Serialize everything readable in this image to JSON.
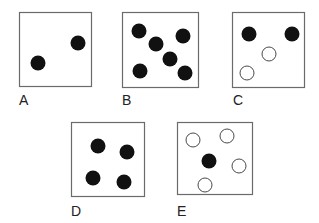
{
  "colors": {
    "background": "#ffffff",
    "box_stroke": "#6b6b6b",
    "filled_dot": "#111111",
    "open_dot_stroke": "#4a4a4a",
    "open_dot_fill": "#ffffff",
    "label": "#222222"
  },
  "dot_radius": 7.5,
  "panels": [
    {
      "label": "A",
      "box": {
        "x": 19,
        "y": 12,
        "w": 72,
        "h": 74
      },
      "label_pos": {
        "x": 19,
        "y": 93
      },
      "dots": [
        {
          "cx": 38,
          "cy": 63,
          "filled": true
        },
        {
          "cx": 78,
          "cy": 43,
          "filled": true
        }
      ]
    },
    {
      "label": "B",
      "box": {
        "x": 122,
        "y": 12,
        "w": 76,
        "h": 75
      },
      "label_pos": {
        "x": 122,
        "y": 93
      },
      "dots": [
        {
          "cx": 139,
          "cy": 31,
          "filled": true
        },
        {
          "cx": 156,
          "cy": 44,
          "filled": true
        },
        {
          "cx": 183,
          "cy": 36,
          "filled": true
        },
        {
          "cx": 170,
          "cy": 59,
          "filled": true
        },
        {
          "cx": 140,
          "cy": 71,
          "filled": true
        },
        {
          "cx": 185,
          "cy": 73,
          "filled": true
        }
      ]
    },
    {
      "label": "C",
      "box": {
        "x": 232,
        "y": 12,
        "w": 72,
        "h": 75
      },
      "label_pos": {
        "x": 233,
        "y": 93
      },
      "dots": [
        {
          "cx": 249,
          "cy": 34,
          "filled": true
        },
        {
          "cx": 292,
          "cy": 34,
          "filled": true
        },
        {
          "cx": 269,
          "cy": 54,
          "filled": false
        },
        {
          "cx": 247,
          "cy": 73,
          "filled": false
        }
      ]
    },
    {
      "label": "D",
      "box": {
        "x": 71,
        "y": 122,
        "w": 73,
        "h": 74
      },
      "label_pos": {
        "x": 71,
        "y": 204
      },
      "dots": [
        {
          "cx": 98,
          "cy": 146,
          "filled": true
        },
        {
          "cx": 127,
          "cy": 152,
          "filled": true
        },
        {
          "cx": 93,
          "cy": 178,
          "filled": true
        },
        {
          "cx": 124,
          "cy": 182,
          "filled": true
        }
      ]
    },
    {
      "label": "E",
      "box": {
        "x": 177,
        "y": 122,
        "w": 75,
        "h": 72
      },
      "label_pos": {
        "x": 177,
        "y": 204
      },
      "dots": [
        {
          "cx": 193,
          "cy": 140,
          "filled": false
        },
        {
          "cx": 227,
          "cy": 136,
          "filled": false
        },
        {
          "cx": 209,
          "cy": 161,
          "filled": true
        },
        {
          "cx": 239,
          "cy": 166,
          "filled": false
        },
        {
          "cx": 205,
          "cy": 185,
          "filled": false
        }
      ]
    }
  ]
}
